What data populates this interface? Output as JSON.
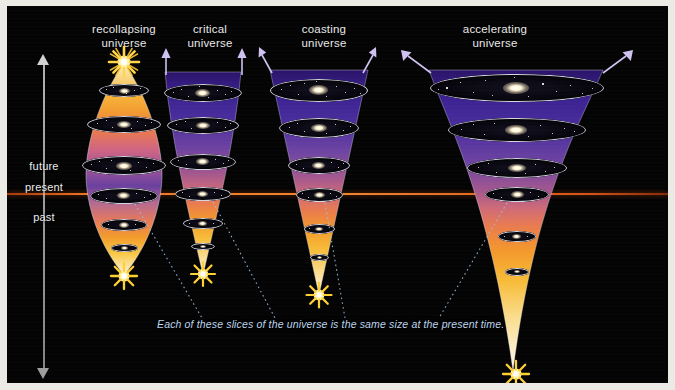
{
  "figure": {
    "background_color": "#040404",
    "frame_color": "#eceae4",
    "caption": "Each of these slices of the universe is the same size at the present time.",
    "present_line_color": "#ff7a22"
  },
  "time_axis": {
    "labels": [
      {
        "text": "future",
        "y": 160
      },
      {
        "text": "present",
        "y": 181
      },
      {
        "text": "past",
        "y": 211
      }
    ],
    "direction_up": "future",
    "direction_down": "past"
  },
  "universes": [
    {
      "id": "recollapsing",
      "title": "recollapsing\nuniverse",
      "title_x": 62,
      "title_y": 18,
      "title_w": 110,
      "shape": "lens",
      "origin": "big-bang",
      "terminus": "big-crunch",
      "has_top_arrows": false,
      "slice_count": 6,
      "center_x": 117,
      "big_bang_y": 268,
      "big_crunch_y": 56
    },
    {
      "id": "critical",
      "title": "critical\nuniverse",
      "title_x": 156,
      "title_y": 18,
      "title_w": 100,
      "shape": "decelerating-cone",
      "origin": "big-bang",
      "terminus": "expands-forever",
      "has_top_arrows": true,
      "slice_count": 6,
      "center_x": 196,
      "big_bang_y": 267
    },
    {
      "id": "coasting",
      "title": "coasting\nuniverse",
      "title_x": 265,
      "title_y": 18,
      "title_w": 110,
      "shape": "linear-cone",
      "origin": "big-bang",
      "terminus": "expands-forever",
      "has_top_arrows": true,
      "slice_count": 6,
      "center_x": 312,
      "big_bang_y": 288
    },
    {
      "id": "accelerating",
      "title": "accelerating\nuniverse",
      "title_x": 422,
      "title_y": 18,
      "title_w": 130,
      "shape": "flared-cone",
      "origin": "big-bang",
      "terminus": "accelerating-expansion",
      "has_top_arrows": true,
      "slice_count": 6,
      "center_x": 509,
      "big_bang_y": 366
    }
  ],
  "gradient": {
    "top": "#120a2e",
    "upper_mid": "#4b2f9e",
    "mid": "#9a5090",
    "lower_mid": "#f08a39",
    "bottom": "#fdf3d8"
  },
  "icons": {
    "time_arrow": "double-arrow-vertical-icon",
    "big_bang": "starburst-icon",
    "expansion": "arrow-up-icon"
  }
}
